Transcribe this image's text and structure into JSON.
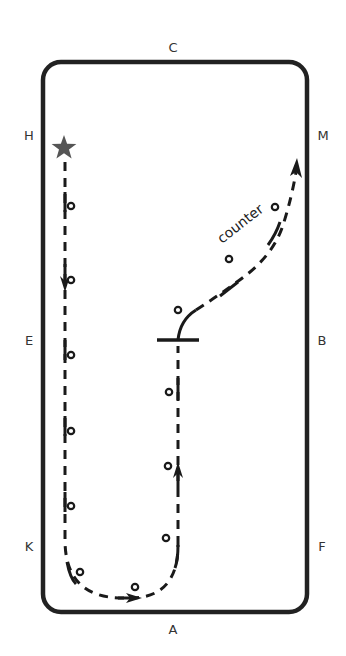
{
  "arena": {
    "type": "dressage arena diagram",
    "letters": {
      "top": "C",
      "bottom": "A",
      "left_top": "H",
      "left_middle": "E",
      "left_bottom": "K",
      "right_top": "M",
      "right_middle": "B",
      "right_bottom": "F"
    }
  },
  "route": {
    "start_marker": "star",
    "annotation": "counter",
    "segments": [
      "Start at H, track left down long side (H to K)",
      "Corner through A end, turn up centerline",
      "Halt/transition at X (line at B-E level)",
      "Curve to M on counter canter"
    ]
  },
  "colors": {
    "outline": "#222222",
    "path": "#1a1a1a",
    "star": "#555555",
    "letters": "#333333"
  }
}
